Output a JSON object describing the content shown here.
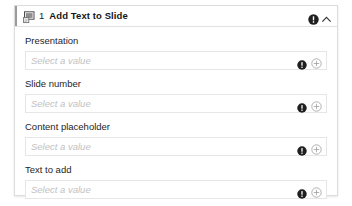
{
  "card": {
    "header": {
      "icon": "slide-icon",
      "step_number": "1",
      "title": "Add Text to Slide",
      "alert_icon": "alert-exclamation-icon",
      "collapse_icon": "chevron-up-icon"
    },
    "fields": [
      {
        "label": "Presentation",
        "placeholder": "Select a value",
        "value": "",
        "alert_icon": "alert-exclamation-icon",
        "add_icon": "circle-plus-icon"
      },
      {
        "label": "Slide number",
        "placeholder": "Select a value",
        "value": "",
        "alert_icon": "alert-exclamation-icon",
        "add_icon": "circle-plus-icon"
      },
      {
        "label": "Content placeholder",
        "placeholder": "Select a value",
        "value": "",
        "alert_icon": "alert-exclamation-icon",
        "add_icon": "circle-plus-icon"
      },
      {
        "label": "Text to add",
        "placeholder": "Select a value",
        "value": "",
        "alert_icon": "alert-exclamation-icon",
        "add_icon": "circle-plus-icon"
      }
    ]
  },
  "colors": {
    "card_border": "#dcdcdc",
    "input_border": "#e6e6e6",
    "placeholder_text": "#c2c2c2",
    "label_text": "#1e1e1e",
    "title_text": "#161616",
    "alert_badge": "#1f1f1f",
    "add_icon": "#a8a8a8",
    "background": "#ffffff"
  }
}
